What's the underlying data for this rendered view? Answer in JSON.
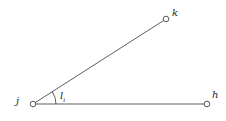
{
  "diagram": {
    "type": "angle-diagram",
    "nodes": [
      {
        "id": "j",
        "label": "j",
        "x": 33,
        "y": 104
      },
      {
        "id": "k",
        "label": "k",
        "x": 166,
        "y": 19
      },
      {
        "id": "h",
        "label": "h",
        "x": 207,
        "y": 104
      }
    ],
    "edges": [
      {
        "from": "j",
        "to": "k"
      },
      {
        "from": "j",
        "to": "h"
      }
    ],
    "angle": {
      "vertex": "j",
      "label_main": "l",
      "label_sub": "i"
    },
    "colors": {
      "line": "#333333",
      "node_fill": "#ffffff",
      "text": "#222222"
    }
  }
}
